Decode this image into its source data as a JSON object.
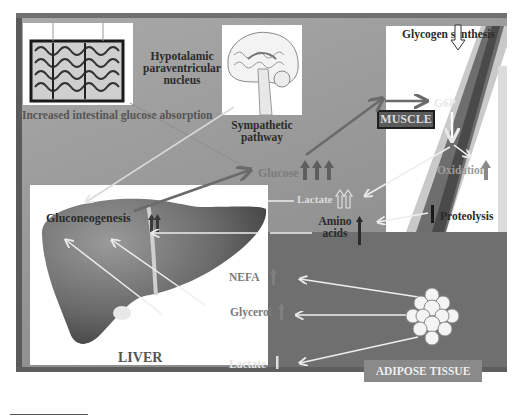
{
  "diagram": {
    "organs": {
      "intestine": {
        "label": "Increased intestinal glucose absorption",
        "icon": "intestine-illustration"
      },
      "brain": {
        "label": "Hypotalamic paraventricular nucleus",
        "icon": "brain-illustration",
        "pathway_label": "Sympathetic pathway"
      },
      "liver": {
        "label": "LIVER",
        "process": "Gluconeogenesis",
        "process_change": "up-up",
        "icon": "liver-illustration"
      },
      "muscle": {
        "label": "MUSCLE",
        "icon": "muscle-illustration",
        "glycogen_synthesis": "Glycogen synthesis",
        "glycogen_change": "down",
        "g6p": "G6P",
        "oxidation": "Oxidation",
        "oxidation_change": "up",
        "proteolysis": "Proteolysis",
        "proteolysis_change": "up"
      },
      "adipose": {
        "label": "ADIPOSE TISSUE",
        "icon": "adipocyte-cluster"
      }
    },
    "metabolites": [
      {
        "name": "Glucose",
        "change": "up-up-up"
      },
      {
        "name": "Lactate",
        "change": "up-up",
        "source": "muscle"
      },
      {
        "name": "Amino acids",
        "change": "up",
        "source": "muscle"
      },
      {
        "name": "NEFA",
        "change": "up",
        "source": "adipose"
      },
      {
        "name": "Glycerol",
        "change": "up",
        "source": "adipose"
      },
      {
        "name": "Lactate",
        "change": "unchanged",
        "source": "adipose"
      }
    ],
    "colors": {
      "background": "#9a9a9a",
      "panel": "#ffffff",
      "adipose_bg": "#6f6f6f",
      "arrow_light": "#e6e6e6",
      "arrow_dark": "#6a6a6a"
    }
  }
}
